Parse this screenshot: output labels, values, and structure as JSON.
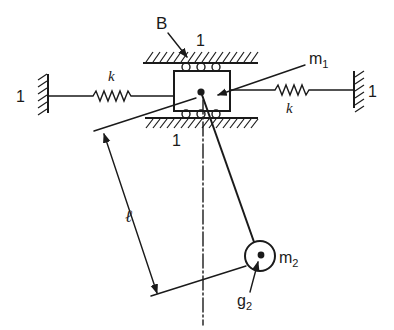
{
  "figure": {
    "type": "mechanical-schematic"
  },
  "labels": {
    "bearing": "B",
    "ground_top": "1",
    "ground_bottom": "1",
    "ground_left": "1",
    "ground_right": "1",
    "spring_left": "k",
    "spring_right": "k",
    "mass1": "m",
    "mass1_sub": "1",
    "mass2": "m",
    "mass2_sub": "2",
    "cg2": "g",
    "cg2_sub": "2",
    "length": "ℓ"
  },
  "colors": {
    "ink": "#1a1a1a",
    "background": "#ffffff"
  }
}
